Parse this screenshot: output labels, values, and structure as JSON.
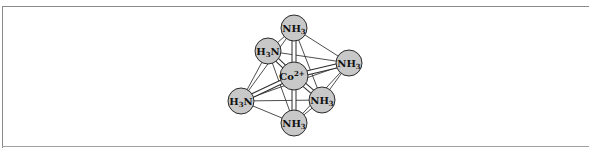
{
  "diagram": {
    "colors": {
      "atom_fill": "#c8c8c8",
      "atom_stroke": "#2a2a2a",
      "frame": "#8a8a8a"
    },
    "center": {
      "label": "Co",
      "charge": "2+",
      "x": 294,
      "y": 76,
      "r": 14
    },
    "ligands": [
      {
        "id": "top",
        "label": "NH",
        "sub": "3",
        "prefix": "",
        "x": 294,
        "y": 28,
        "r": 13
      },
      {
        "id": "upper-left",
        "label": "N",
        "sub": "3",
        "prefix": "H",
        "x": 268,
        "y": 51,
        "r": 13
      },
      {
        "id": "right",
        "label": "NH",
        "sub": "3",
        "prefix": "",
        "x": 349,
        "y": 63,
        "r": 13
      },
      {
        "id": "left",
        "label": "N",
        "sub": "3",
        "prefix": "H",
        "x": 241,
        "y": 101,
        "r": 13
      },
      {
        "id": "lower-right",
        "label": "NH",
        "sub": "3",
        "prefix": "",
        "x": 322,
        "y": 100,
        "r": 13
      },
      {
        "id": "bottom",
        "label": "NH",
        "sub": "3",
        "prefix": "",
        "x": 294,
        "y": 123,
        "r": 13
      }
    ],
    "labels": {
      "top": "NH3",
      "upper_left": "H3N",
      "right": "NH3",
      "left": "H3N",
      "lower_right": "NH3",
      "bottom": "NH3",
      "center": "Co2+"
    }
  }
}
